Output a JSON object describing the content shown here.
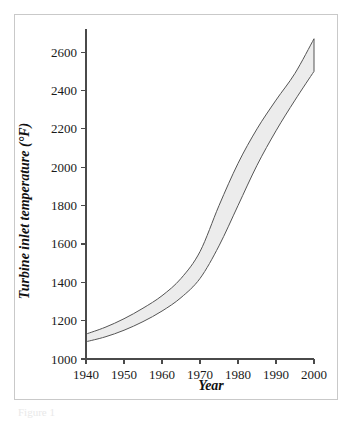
{
  "figure": {
    "frame_border_color": "#c9c9c9",
    "background_color": "#ffffff",
    "caption_fragment": "Figure 1"
  },
  "chart_data": {
    "type": "area",
    "title": "",
    "subtitle": "",
    "xlabel": "Year",
    "ylabel": "Turbine inlet temperature (°F)",
    "xlim": [
      1940,
      2000
    ],
    "ylim": [
      1000,
      2700
    ],
    "xticks": [
      1940,
      1950,
      1960,
      1970,
      1980,
      1990,
      2000
    ],
    "xtick_labels": [
      "1940",
      "1950",
      "1960",
      "1970",
      "1980",
      "1990",
      "2000"
    ],
    "yticks": [
      1000,
      1200,
      1400,
      1600,
      1800,
      2000,
      2200,
      2400,
      2600
    ],
    "ytick_labels": [
      "1000",
      "1200",
      "1400",
      "1600",
      "1800",
      "2000",
      "2200",
      "2400",
      "2600"
    ],
    "grid": false,
    "legend": false,
    "legend_position": "none",
    "band_fill_color": "#ececec",
    "band_stroke_color": "#555555",
    "axis_color": "#4a4a4a",
    "x": [
      1940,
      1945,
      1950,
      1955,
      1960,
      1965,
      1970,
      1975,
      1980,
      1985,
      1990,
      1995,
      2000
    ],
    "series": [
      {
        "name": "Upper bound",
        "values": [
          1130,
          1165,
          1210,
          1265,
          1330,
          1420,
          1560,
          1800,
          2020,
          2200,
          2350,
          2490,
          2670
        ]
      },
      {
        "name": "Lower bound",
        "values": [
          1090,
          1115,
          1150,
          1195,
          1250,
          1320,
          1420,
          1590,
          1800,
          2010,
          2190,
          2350,
          2500
        ]
      }
    ],
    "annotations": []
  }
}
